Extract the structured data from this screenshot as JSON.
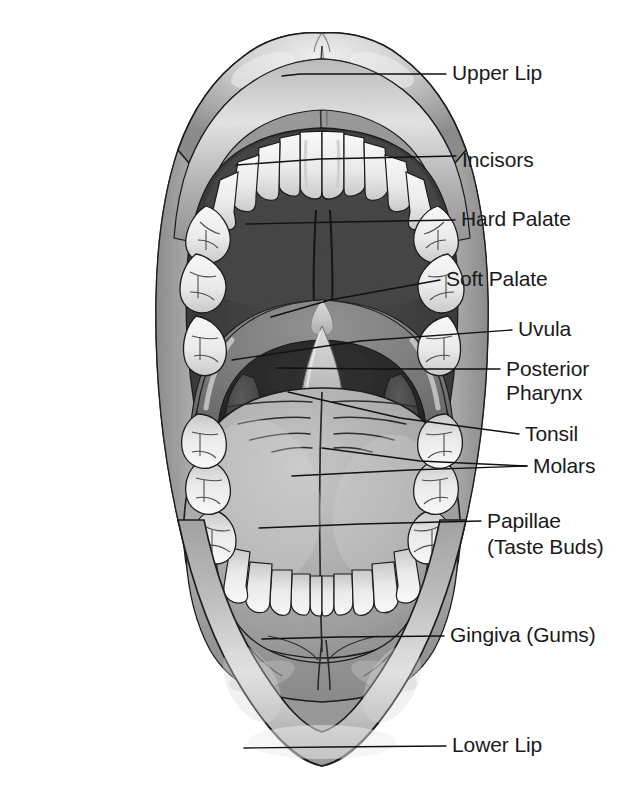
{
  "figure": {
    "type": "anatomical-illustration",
    "style": "grayscale medical line drawing with leader-line callouts",
    "background_color": "#ffffff",
    "label_color": "#1a1a1a",
    "leader_line_color": "#111111"
  },
  "palette": {
    "lip_light": "#e9e9e9",
    "lip_mid": "#b4b4b4",
    "lip_dark": "#8e8e8e",
    "mucosa_gray": "#9a9a9a",
    "hard_palate_dark": "#454545",
    "oral_cavity_dark": "#3a3a3a",
    "pharynx_darkest": "#262626",
    "soft_palate_gray": "#7e7e7e",
    "uvula_light": "#cfcfcf",
    "tongue_gray": "#aaaaaa",
    "tongue_light": "#c6c6c6",
    "tooth_white": "#f4f4f4",
    "tooth_shadow": "#c9c9c9",
    "gingiva_gray": "#9d9d9d",
    "outline": "#1d1d1d"
  },
  "labels": [
    {
      "id": "upper-lip",
      "text": "Upper Lip",
      "text_x": 452,
      "text_y": 74,
      "leader": "M282,76 L300,74 L446,74",
      "target": "upper lip vermilion, right side"
    },
    {
      "id": "incisors",
      "text": "Incisors",
      "text_x": 462,
      "text_y": 161,
      "leader": "M236,165 L320,159 L456,156",
      "target": "upper central and lateral incisors"
    },
    {
      "id": "hard-palate",
      "text": "Hard Palate",
      "text_x": 461,
      "text_y": 220,
      "leader": "M246,224 L340,222 L455,220",
      "target": "hard palate (roof of mouth)"
    },
    {
      "id": "soft-palate",
      "text": "Soft Palate",
      "text_x": 446,
      "text_y": 280,
      "leader": "M271,317 L330,300 L440,280",
      "target": "soft palate arch"
    },
    {
      "id": "uvula",
      "text": "Uvula",
      "text_x": 518,
      "text_y": 330,
      "leader": "M232,360 L360,341 L512,330",
      "target": "uvula"
    },
    {
      "id": "posterior-pharynx",
      "text": "Posterior",
      "text_line2": "Pharynx",
      "text_x": 506,
      "text_y": 370,
      "text_y2": 394,
      "leader": "M276,368 L380,369 L500,369",
      "target": "posterior pharyngeal wall"
    },
    {
      "id": "tonsil",
      "text": "Tonsil",
      "text_x": 525,
      "text_y": 435,
      "leader": "M288,392 L400,418 L519,434",
      "target": "palatine tonsil"
    },
    {
      "id": "molars",
      "text": "Molars",
      "text_x": 533,
      "text_y": 467,
      "leader": "M322,448 L420,461 L527,466",
      "leader2": "M292,476 L410,470 L527,466",
      "target": "upper and lower molar teeth"
    },
    {
      "id": "papillae",
      "text": "Papillae",
      "text_line2": "(Taste Buds)",
      "text_x": 487,
      "text_y": 522,
      "text_y2": 548,
      "leader": "M259,528 L360,524 L481,521",
      "target": "lingual papillae on tongue dorsum"
    },
    {
      "id": "gingiva",
      "text": "Gingiva (Gums)",
      "text_x": 450,
      "text_y": 636,
      "leader": "M262,639 L340,637 L444,636",
      "target": "lower gingiva"
    },
    {
      "id": "lower-lip",
      "text": "Lower Lip",
      "text_x": 452,
      "text_y": 746,
      "leader": "M244,748 L330,747 L446,746",
      "target": "lower lip vermilion"
    }
  ],
  "structures": [
    {
      "id": "upper-lip-body",
      "name": "Upper lip"
    },
    {
      "id": "lower-lip-body",
      "name": "Lower lip"
    },
    {
      "id": "buccal-mucosa",
      "name": "Buccal mucosa / cheek lining"
    },
    {
      "id": "hard-palate-body",
      "name": "Hard palate"
    },
    {
      "id": "soft-palate-body",
      "name": "Soft palate"
    },
    {
      "id": "uvula-body",
      "name": "Uvula"
    },
    {
      "id": "pharynx-body",
      "name": "Posterior pharynx"
    },
    {
      "id": "tonsil-left",
      "name": "Left palatine tonsil"
    },
    {
      "id": "tonsil-right",
      "name": "Right palatine tonsil"
    },
    {
      "id": "tongue-body",
      "name": "Tongue"
    },
    {
      "id": "upper-teeth",
      "name": "Upper dental arch"
    },
    {
      "id": "lower-teeth",
      "name": "Lower dental arch"
    },
    {
      "id": "gingiva-body",
      "name": "Gingiva"
    }
  ]
}
